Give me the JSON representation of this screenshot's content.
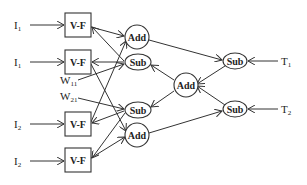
{
  "diagram": {
    "inputs": [
      {
        "main": "I",
        "sub": "1"
      },
      {
        "main": "I",
        "sub": "1"
      },
      {
        "main": "I",
        "sub": "2"
      },
      {
        "main": "I",
        "sub": "2"
      }
    ],
    "vf_label": "V-F",
    "weights": [
      {
        "main": "W",
        "sub": "11"
      },
      {
        "main": "W",
        "sub": "21"
      }
    ],
    "left_nodes": [
      "Add",
      "Sub",
      "Sub",
      "Add"
    ],
    "center_node": "Add",
    "right_nodes": [
      "Sub",
      "Sub"
    ],
    "targets": [
      {
        "main": "T",
        "sub": "1"
      },
      {
        "main": "T",
        "sub": "2"
      }
    ]
  }
}
